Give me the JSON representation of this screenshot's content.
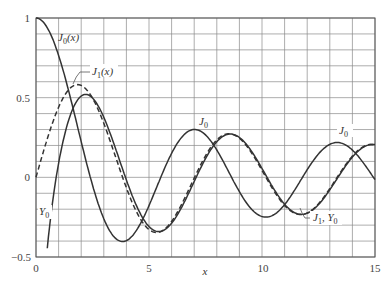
{
  "chart_data": {
    "type": "line",
    "title": "",
    "xlabel": "x",
    "ylabel": "",
    "xlim": [
      0,
      15
    ],
    "ylim": [
      -0.5,
      1
    ],
    "grid": true,
    "grid_x_step": 1,
    "grid_y_step": 0.1,
    "x_ticks": [
      0,
      5,
      10,
      15
    ],
    "x_tick_labels": [
      "0",
      "5",
      "10",
      "15"
    ],
    "y_ticks": [
      -0.5,
      0,
      0.5,
      1
    ],
    "y_tick_labels": [
      "−0.5",
      "0",
      "0.5",
      "1"
    ],
    "x": [
      0,
      1,
      2,
      3,
      4,
      5,
      6,
      7,
      8,
      9,
      10,
      11,
      12,
      13,
      14,
      15
    ],
    "series": [
      {
        "name": "J0(x)",
        "style": "solid",
        "values": [
          1.0,
          0.765,
          0.224,
          -0.26,
          -0.397,
          -0.178,
          0.151,
          0.3,
          0.172,
          -0.09,
          -0.246,
          -0.171,
          0.048,
          0.207,
          0.171,
          -0.014
        ]
      },
      {
        "name": "J1(x)",
        "style": "dashed",
        "values": [
          0.0,
          0.44,
          0.577,
          0.339,
          -0.066,
          -0.328,
          -0.277,
          -0.005,
          0.235,
          0.245,
          0.043,
          -0.177,
          -0.223,
          -0.07,
          0.133,
          0.205
        ]
      },
      {
        "name": "Y0(x)",
        "style": "solid",
        "values": [
          null,
          0.088,
          0.51,
          0.377,
          -0.017,
          -0.309,
          -0.288,
          -0.026,
          0.224,
          0.25,
          0.056,
          -0.169,
          -0.225,
          -0.078,
          0.127,
          0.206
        ]
      }
    ],
    "annotations": [
      {
        "text": "J0(x)",
        "x": 1.0,
        "y": 0.88
      },
      {
        "text": "J1(x)",
        "x": 2.5,
        "y": 0.65
      },
      {
        "text": "J0",
        "x": 7.2,
        "y": 0.35
      },
      {
        "text": "J0",
        "x": 13.4,
        "y": 0.3
      },
      {
        "text": "Y0",
        "x": 0.3,
        "y": -0.22
      },
      {
        "text": "J1, Y0",
        "x": 12.4,
        "y": -0.27
      }
    ]
  },
  "labels": {
    "j0x_main": "J",
    "j0x_sub": "0",
    "j0x_arg": "(x)",
    "j1x_main": "J",
    "j1x_sub": "1",
    "j1x_arg": "(x)",
    "j0_a_main": "J",
    "j0_a_sub": "0",
    "j0_b_main": "J",
    "j0_b_sub": "0",
    "y0_main": "Y",
    "y0_sub": "0",
    "j1y0_j": "J",
    "j1y0_jsub": "1",
    "j1y0_sep": ", ",
    "j1y0_y": "Y",
    "j1y0_ysub": "0",
    "xlabel": "x"
  },
  "ticks": {
    "x0": "0",
    "x5": "5",
    "x10": "10",
    "x15": "15",
    "y1": "1",
    "y05": "0.5",
    "y0": "0",
    "ym05": "−0.5"
  }
}
